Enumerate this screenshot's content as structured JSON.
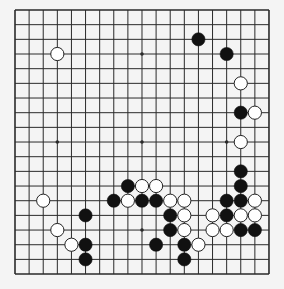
{
  "board": {
    "size": 19,
    "origin_x": 15,
    "origin_y": 10,
    "spacing_x": 14.11,
    "spacing_y": 14.67,
    "stone_radius": 6.6,
    "colors": {
      "background": "#f4f4f4",
      "line": "#2a2a2a",
      "black_stone": "#111111",
      "white_stone": "#ffffff",
      "white_stone_edge": "#222222"
    },
    "star_points": [
      [
        3,
        3
      ],
      [
        9,
        3
      ],
      [
        15,
        3
      ],
      [
        3,
        9
      ],
      [
        9,
        9
      ],
      [
        15,
        9
      ],
      [
        3,
        15
      ],
      [
        9,
        15
      ],
      [
        15,
        15
      ]
    ],
    "black_stones": [
      [
        13,
        2
      ],
      [
        15,
        3
      ],
      [
        16,
        7
      ],
      [
        16,
        11
      ],
      [
        16,
        12
      ],
      [
        15,
        13
      ],
      [
        16,
        13
      ],
      [
        15,
        14
      ],
      [
        16,
        15
      ],
      [
        17,
        15
      ],
      [
        8,
        12
      ],
      [
        7,
        13
      ],
      [
        9,
        13
      ],
      [
        10,
        13
      ],
      [
        11,
        14
      ],
      [
        11,
        15
      ],
      [
        10,
        16
      ],
      [
        12,
        16
      ],
      [
        12,
        17
      ],
      [
        5,
        14
      ],
      [
        5,
        16
      ],
      [
        5,
        17
      ]
    ],
    "white_stones": [
      [
        3,
        3
      ],
      [
        16,
        5
      ],
      [
        17,
        7
      ],
      [
        16,
        9
      ],
      [
        17,
        13
      ],
      [
        14,
        14
      ],
      [
        16,
        14
      ],
      [
        17,
        14
      ],
      [
        14,
        15
      ],
      [
        15,
        15
      ],
      [
        9,
        12
      ],
      [
        10,
        12
      ],
      [
        8,
        13
      ],
      [
        11,
        13
      ],
      [
        12,
        13
      ],
      [
        12,
        14
      ],
      [
        12,
        15
      ],
      [
        13,
        16
      ],
      [
        2,
        13
      ],
      [
        3,
        15
      ],
      [
        4,
        16
      ]
    ]
  }
}
